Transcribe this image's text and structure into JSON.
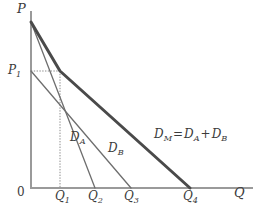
{
  "figure": {
    "background": "#ffffff",
    "width": 259,
    "height": 218
  },
  "axes": {
    "y_label": "P",
    "x_label": "Q",
    "origin_label": "0",
    "axis_color": "#9a9a9a"
  },
  "ticks": {
    "price": [
      {
        "id": "P1",
        "base": "P",
        "sub": "1",
        "y_px": 71
      }
    ],
    "quantity": [
      {
        "id": "Q1",
        "base": "Q",
        "sub": "1",
        "x_px": 60
      },
      {
        "id": "Q2",
        "base": "Q",
        "sub": "2",
        "x_px": 95
      },
      {
        "id": "Q3",
        "base": "Q",
        "sub": "3",
        "x_px": 131
      },
      {
        "id": "Q4",
        "base": "Q",
        "sub": "4",
        "x_px": 190
      }
    ]
  },
  "curves": {
    "demand_a": {
      "base": "D",
      "sub": "A",
      "color": "#6e6e6e",
      "width": 1.3,
      "from": {
        "x": 31,
        "y": 22
      },
      "to": {
        "x": 95,
        "y": 188
      }
    },
    "demand_b": {
      "base": "D",
      "sub": "B",
      "color": "#6e6e6e",
      "width": 1.3,
      "from": {
        "x": 31,
        "y": 71
      },
      "to": {
        "x": 131,
        "y": 188
      }
    },
    "demand_market": {
      "base": "D",
      "sub": "M",
      "equals": "=",
      "plus": "+",
      "term_a_base": "D",
      "term_a_sub": "A",
      "term_b_base": "D",
      "term_b_sub": "B",
      "color": "#4a4a4a",
      "width": 3.0,
      "upper_from": {
        "x": 31,
        "y": 22
      },
      "kink": {
        "x": 60,
        "y": 71
      },
      "to": {
        "x": 190,
        "y": 188
      }
    }
  },
  "guides": {
    "dotted_color": "#8c8c8c",
    "horizontal": {
      "from_x": 31,
      "to_x": 60,
      "y": 71
    },
    "vertical": {
      "x": 60,
      "from_y": 71,
      "to_y": 188
    }
  }
}
